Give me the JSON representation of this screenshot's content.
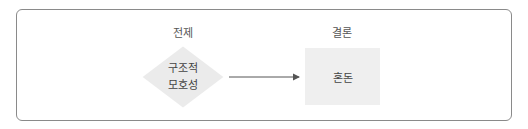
{
  "diagram": {
    "premise": {
      "heading": "전제",
      "node_shape": "diamond",
      "node_lines": [
        "구조적",
        "모호성"
      ]
    },
    "conclusion": {
      "heading": "결론",
      "node_shape": "rectangle",
      "node_text": "혼돈"
    },
    "edge": {
      "from": "구조적 모호성",
      "to": "혼돈",
      "type": "arrow"
    },
    "colors": {
      "border": "#8a8a8a",
      "node_fill": "#ebebeb",
      "arrow": "#555555",
      "text": "#444444"
    }
  }
}
